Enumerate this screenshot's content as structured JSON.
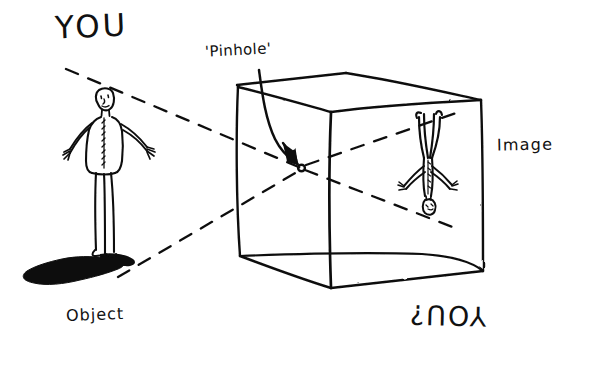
{
  "figure": {
    "kind": "hand-drawn-diagram",
    "background_color": "#ffffff",
    "ink_color": "#111111"
  },
  "labels": {
    "you_top": "YOU",
    "pinhole": "'Pinhole'",
    "image": "Image",
    "object": "Object",
    "you_bottom": "YOU?"
  },
  "annotations": {
    "pinhole_arrow": "curved-arrow-to-pinhole",
    "pinhole_dot": "pinhole-aperture-dot",
    "upper_ray": "dashed ray from head of object through pinhole to bottom of image",
    "lower_ray": "dashed ray from feet of object through pinhole to top of image"
  },
  "scene": {
    "object_figure": "standing person with outstretched arms casting a shadow",
    "image_figure": "inverted person projected on the back wall of the box",
    "box": "open-front rectangular box drawn in perspective"
  },
  "geometry": {
    "box_front_top_left": [
      237,
      85
    ],
    "box_front_top_right": [
      330,
      112
    ],
    "box_back_top_left": [
      345,
      73
    ],
    "box_back_top_right": [
      481,
      100
    ],
    "box_front_bottom_left": [
      240,
      256
    ],
    "box_front_bottom_right": [
      331,
      288
    ],
    "box_back_bottom_right": [
      483,
      271
    ],
    "pinhole_point": [
      301,
      168
    ],
    "object_center": [
      104,
      175
    ],
    "image_center": [
      428,
      165
    ]
  }
}
